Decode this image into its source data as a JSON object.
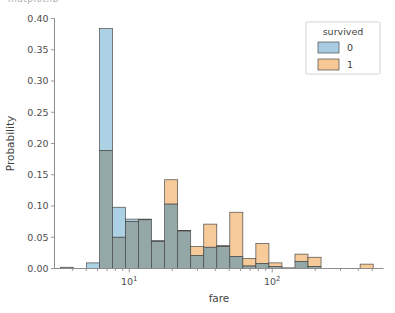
{
  "figure": {
    "clipped_top_text": "matplotlib",
    "background": "#ffffff",
    "width": 395,
    "height": 313
  },
  "chart_data": {
    "type": "bar",
    "chart_subtype": "histogram-overlapping-log-x",
    "title": "",
    "xlabel": "fare",
    "ylabel": "Probability",
    "xscale": "log",
    "yscale": "linear",
    "xlim": [
      3.0,
      600.0
    ],
    "ylim": [
      0.0,
      0.4
    ],
    "grid": false,
    "legend": {
      "title": "survived",
      "position": "upper right",
      "entries": [
        {
          "label": "0",
          "color": "#a8cde3"
        },
        {
          "label": "1",
          "color": "#f7c894"
        }
      ]
    },
    "colors": {
      "series_0": "#a8cde3",
      "series_1": "#f7c894",
      "overlap": "#8fa3a3",
      "edge": "#4a4a4a",
      "axis": "#8d8d8d",
      "text": "#4d4d4d"
    },
    "yticks": [
      0.0,
      0.05,
      0.1,
      0.15,
      0.2,
      0.25,
      0.3,
      0.35,
      0.4
    ],
    "ytick_labels": [
      "0.00",
      "0.05",
      "0.10",
      "0.15",
      "0.20",
      "0.25",
      "0.30",
      "0.35",
      "0.40"
    ],
    "xtick_major": [
      10,
      100
    ],
    "xtick_major_labels": [
      "10¹",
      "10²"
    ],
    "xtick_minor": [
      4,
      5,
      6,
      7,
      8,
      9,
      20,
      30,
      40,
      50,
      60,
      70,
      80,
      90,
      200,
      300,
      400,
      500
    ],
    "bin_edges": [
      3.3,
      4.07,
      5.02,
      6.19,
      7.64,
      9.42,
      11.62,
      14.33,
      17.68,
      21.81,
      26.9,
      33.18,
      40.93,
      50.49,
      62.28,
      76.83,
      94.78,
      116.9,
      144.2,
      177.9,
      219.4,
      270.7,
      333.9,
      411.9,
      508.1
    ],
    "series": [
      {
        "name": "0",
        "legend_label": "0",
        "color": "#a8cde3",
        "values": [
          0.002,
          0.0,
          0.009,
          0.384,
          0.098,
          0.079,
          0.079,
          0.045,
          0.103,
          0.061,
          0.021,
          0.034,
          0.035,
          0.019,
          0.004,
          0.008,
          0.003,
          0.001,
          0.011,
          0.003,
          0.0,
          0.0,
          0.0,
          0.0
        ]
      },
      {
        "name": "1",
        "legend_label": "1",
        "color": "#f7c894",
        "values": [
          0.002,
          0.0,
          0.0,
          0.189,
          0.05,
          0.075,
          0.078,
          0.043,
          0.142,
          0.06,
          0.035,
          0.071,
          0.037,
          0.09,
          0.016,
          0.04,
          0.009,
          0.001,
          0.023,
          0.018,
          0.0,
          0.0,
          0.0,
          0.007
        ]
      }
    ]
  }
}
